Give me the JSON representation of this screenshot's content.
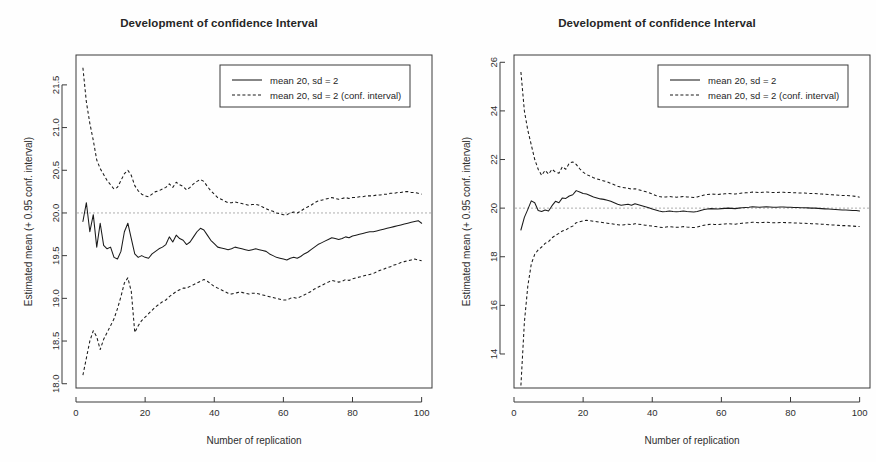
{
  "page": {
    "background_color": "#fefefe",
    "foreground_color": "#1a1a1a"
  },
  "panels": [
    {
      "name": "left-panel",
      "title": "Development of confidence Interval",
      "legend": {
        "solid_label": "mean 20, sd = 2",
        "dashed_label": "mean 20, sd = 2 (conf. interval)"
      }
    },
    {
      "name": "right-panel",
      "title": "Development of confidence Interval",
      "legend": {
        "solid_label": "mean 20, sd = 2",
        "dashed_label": "mean 20, sd = 2 (conf. interval)"
      }
    }
  ],
  "chart_data": [
    {
      "type": "line",
      "name": "left-chart",
      "title": "Development of confidence Interval",
      "xlabel": "Number of replication",
      "ylabel": "Estimated mean (+ 0.95 conf. interval)",
      "xlim": [
        0,
        103
      ],
      "ylim": [
        17.95,
        21.85
      ],
      "xticks": [
        0,
        20,
        40,
        60,
        80,
        100
      ],
      "xtick_labels": [
        "0",
        "20",
        "40",
        "60",
        "80",
        "100"
      ],
      "yticks": [
        18.0,
        18.5,
        19.0,
        19.5,
        20.0,
        20.5,
        21.0,
        21.5
      ],
      "ytick_labels": [
        "18.0",
        "18.5",
        "19.0",
        "19.5",
        "20.0",
        "20.5",
        "21.0",
        "21.5"
      ],
      "grid": false,
      "reference_line": 20.0,
      "legend_position": "top-right",
      "x": [
        2,
        3,
        4,
        5,
        6,
        7,
        8,
        9,
        10,
        11,
        12,
        13,
        14,
        15,
        16,
        17,
        18,
        19,
        20,
        21,
        22,
        23,
        24,
        25,
        26,
        27,
        28,
        29,
        30,
        31,
        32,
        33,
        34,
        35,
        36,
        37,
        38,
        39,
        40,
        41,
        42,
        43,
        44,
        45,
        46,
        47,
        48,
        49,
        50,
        51,
        52,
        53,
        54,
        55,
        56,
        57,
        58,
        59,
        60,
        61,
        62,
        63,
        64,
        65,
        66,
        67,
        68,
        69,
        70,
        71,
        72,
        73,
        74,
        75,
        76,
        77,
        78,
        79,
        80,
        81,
        82,
        83,
        84,
        85,
        86,
        87,
        88,
        89,
        90,
        91,
        92,
        93,
        94,
        95,
        96,
        97,
        98,
        99,
        100
      ],
      "series": [
        {
          "name": "mean 20, sd = 2",
          "style": "solid",
          "values": [
            19.9,
            20.12,
            19.78,
            19.98,
            19.6,
            19.88,
            19.62,
            19.58,
            19.6,
            19.48,
            19.46,
            19.55,
            19.78,
            19.88,
            19.7,
            19.52,
            19.48,
            19.5,
            19.48,
            19.47,
            19.52,
            19.55,
            19.58,
            19.6,
            19.63,
            19.72,
            19.66,
            19.74,
            19.7,
            19.68,
            19.63,
            19.66,
            19.72,
            19.78,
            19.82,
            19.8,
            19.74,
            19.68,
            19.64,
            19.6,
            19.59,
            19.58,
            19.57,
            19.58,
            19.6,
            19.59,
            19.58,
            19.57,
            19.56,
            19.57,
            19.58,
            19.57,
            19.56,
            19.55,
            19.52,
            19.5,
            19.48,
            19.47,
            19.46,
            19.45,
            19.47,
            19.48,
            19.47,
            19.49,
            19.52,
            19.54,
            19.57,
            19.6,
            19.63,
            19.65,
            19.67,
            19.69,
            19.71,
            19.7,
            19.69,
            19.7,
            19.72,
            19.71,
            19.73,
            19.74,
            19.75,
            19.76,
            19.77,
            19.78,
            19.78,
            19.79,
            19.8,
            19.81,
            19.82,
            19.83,
            19.84,
            19.85,
            19.86,
            19.87,
            19.88,
            19.89,
            19.9,
            19.91,
            19.88
          ]
        },
        {
          "name": "mean 20, sd = 2 (upper conf. interval)",
          "style": "dashed",
          "values": [
            21.7,
            21.3,
            21.05,
            20.85,
            20.62,
            20.52,
            20.45,
            20.38,
            20.33,
            20.28,
            20.3,
            20.38,
            20.46,
            20.5,
            20.44,
            20.32,
            20.26,
            20.22,
            20.2,
            20.19,
            20.22,
            20.25,
            20.26,
            20.28,
            20.3,
            20.34,
            20.3,
            20.36,
            20.33,
            20.31,
            20.27,
            20.3,
            20.34,
            20.37,
            20.39,
            20.37,
            20.31,
            20.26,
            20.22,
            20.18,
            20.16,
            20.14,
            20.12,
            20.12,
            20.13,
            20.12,
            20.11,
            20.1,
            20.09,
            20.1,
            20.1,
            20.09,
            20.07,
            20.05,
            20.03,
            20.02,
            20.0,
            19.99,
            19.98,
            19.98,
            20.0,
            20.01,
            20.0,
            20.02,
            20.05,
            20.07,
            20.09,
            20.12,
            20.14,
            20.15,
            20.16,
            20.17,
            20.18,
            20.17,
            20.16,
            20.17,
            20.18,
            20.17,
            20.18,
            20.18,
            20.19,
            20.19,
            20.2,
            20.2,
            20.2,
            20.21,
            20.21,
            20.22,
            20.22,
            20.23,
            20.23,
            20.24,
            20.24,
            20.25,
            20.25,
            20.24,
            20.24,
            20.23,
            20.22
          ]
        },
        {
          "name": "mean 20, sd = 2 (lower conf. interval)",
          "style": "dashed",
          "values": [
            18.1,
            18.3,
            18.5,
            18.62,
            18.55,
            18.4,
            18.52,
            18.6,
            18.68,
            18.76,
            18.88,
            19.02,
            19.18,
            19.24,
            19.08,
            18.6,
            18.68,
            18.74,
            18.78,
            18.82,
            18.86,
            18.9,
            18.93,
            18.96,
            18.98,
            19.02,
            19.05,
            19.08,
            19.1,
            19.12,
            19.12,
            19.14,
            19.16,
            19.18,
            19.2,
            19.22,
            19.2,
            19.17,
            19.14,
            19.12,
            19.1,
            19.08,
            19.06,
            19.05,
            19.06,
            19.07,
            19.07,
            19.06,
            19.05,
            19.06,
            19.06,
            19.05,
            19.04,
            19.03,
            19.02,
            19.01,
            19.0,
            18.99,
            18.98,
            18.98,
            19.0,
            19.01,
            19.0,
            19.02,
            19.04,
            19.06,
            19.08,
            19.11,
            19.13,
            19.15,
            19.17,
            19.19,
            19.21,
            19.2,
            19.19,
            19.2,
            19.22,
            19.21,
            19.23,
            19.24,
            19.25,
            19.26,
            19.27,
            19.28,
            19.29,
            19.31,
            19.33,
            19.34,
            19.36,
            19.37,
            19.39,
            19.4,
            19.42,
            19.43,
            19.44,
            19.45,
            19.46,
            19.45,
            19.44
          ]
        }
      ]
    },
    {
      "type": "line",
      "name": "right-chart",
      "title": "Development of confidence Interval",
      "xlabel": "Number of replication",
      "ylabel": "Estimated mean (+ 0.95 conf. interval)",
      "xlim": [
        0,
        103
      ],
      "ylim": [
        12.6,
        26.3
      ],
      "xticks": [
        0,
        20,
        40,
        60,
        80,
        100
      ],
      "xtick_labels": [
        "0",
        "20",
        "40",
        "60",
        "80",
        "100"
      ],
      "yticks": [
        14,
        16,
        18,
        20,
        22,
        24,
        26
      ],
      "ytick_labels": [
        "14",
        "16",
        "18",
        "20",
        "22",
        "24",
        "26"
      ],
      "grid": false,
      "reference_line": 20.0,
      "legend_position": "top-right",
      "x": [
        2,
        3,
        4,
        5,
        6,
        7,
        8,
        9,
        10,
        11,
        12,
        13,
        14,
        15,
        16,
        17,
        18,
        19,
        20,
        21,
        22,
        23,
        24,
        25,
        26,
        27,
        28,
        29,
        30,
        31,
        32,
        33,
        34,
        35,
        36,
        37,
        38,
        39,
        40,
        41,
        42,
        43,
        44,
        45,
        46,
        47,
        48,
        49,
        50,
        51,
        52,
        53,
        54,
        55,
        56,
        57,
        58,
        59,
        60,
        61,
        62,
        63,
        64,
        65,
        66,
        67,
        68,
        69,
        70,
        71,
        72,
        73,
        74,
        75,
        76,
        77,
        78,
        79,
        80,
        81,
        82,
        83,
        84,
        85,
        86,
        87,
        88,
        89,
        90,
        91,
        92,
        93,
        94,
        95,
        96,
        97,
        98,
        99,
        100
      ],
      "series": [
        {
          "name": "mean 20, sd = 2",
          "style": "solid",
          "values": [
            19.1,
            19.62,
            19.95,
            20.3,
            20.22,
            19.9,
            19.86,
            19.92,
            19.88,
            20.1,
            20.28,
            20.22,
            20.42,
            20.4,
            20.5,
            20.55,
            20.72,
            20.66,
            20.6,
            20.58,
            20.52,
            20.46,
            20.42,
            20.38,
            20.36,
            20.32,
            20.28,
            20.22,
            20.16,
            20.12,
            20.14,
            20.16,
            20.12,
            20.18,
            20.14,
            20.1,
            20.06,
            20.02,
            19.96,
            19.92,
            19.88,
            19.85,
            19.86,
            19.88,
            19.86,
            19.85,
            19.86,
            19.88,
            19.86,
            19.85,
            19.84,
            19.86,
            19.9,
            19.94,
            19.96,
            19.98,
            19.97,
            19.96,
            19.98,
            19.99,
            20.0,
            19.99,
            19.98,
            20.0,
            20.02,
            20.03,
            20.04,
            20.06,
            20.05,
            20.04,
            20.05,
            20.06,
            20.05,
            20.04,
            20.04,
            20.05,
            20.05,
            20.04,
            20.04,
            20.03,
            20.03,
            20.02,
            20.02,
            20.01,
            20.0,
            20.0,
            19.99,
            19.98,
            19.97,
            19.96,
            19.95,
            19.94,
            19.93,
            19.92,
            19.92,
            19.91,
            19.9,
            19.9,
            19.88
          ]
        },
        {
          "name": "mean 20, sd = 2 (upper conf. interval)",
          "style": "dashed",
          "values": [
            25.6,
            24.0,
            23.2,
            22.6,
            22.0,
            21.6,
            21.35,
            21.55,
            21.4,
            21.6,
            21.48,
            21.44,
            21.7,
            21.6,
            21.85,
            21.9,
            21.8,
            21.62,
            21.48,
            21.38,
            21.32,
            21.25,
            21.2,
            21.16,
            21.12,
            21.08,
            21.02,
            20.96,
            20.9,
            20.86,
            20.84,
            20.82,
            20.78,
            20.8,
            20.76,
            20.72,
            20.68,
            20.64,
            20.58,
            20.52,
            20.48,
            20.45,
            20.46,
            20.48,
            20.46,
            20.45,
            20.46,
            20.48,
            20.46,
            20.45,
            20.44,
            20.46,
            20.5,
            20.54,
            20.56,
            20.58,
            20.57,
            20.56,
            20.58,
            20.59,
            20.6,
            20.59,
            20.58,
            20.6,
            20.62,
            20.63,
            20.64,
            20.66,
            20.65,
            20.64,
            20.65,
            20.66,
            20.65,
            20.64,
            20.64,
            20.65,
            20.65,
            20.64,
            20.64,
            20.63,
            20.63,
            20.62,
            20.62,
            20.61,
            20.6,
            20.6,
            20.59,
            20.58,
            20.57,
            20.56,
            20.55,
            20.54,
            20.53,
            20.52,
            20.52,
            20.51,
            20.5,
            20.48,
            20.45
          ]
        },
        {
          "name": "mean 20, sd = 2 (lower conf. interval)",
          "style": "dashed",
          "values": [
            12.7,
            15.3,
            16.8,
            17.7,
            18.1,
            18.28,
            18.4,
            18.55,
            18.62,
            18.78,
            18.88,
            18.96,
            19.06,
            19.1,
            19.2,
            19.26,
            19.4,
            19.44,
            19.48,
            19.5,
            19.48,
            19.46,
            19.44,
            19.42,
            19.4,
            19.38,
            19.36,
            19.34,
            19.32,
            19.3,
            19.32,
            19.34,
            19.32,
            19.36,
            19.34,
            19.32,
            19.3,
            19.28,
            19.26,
            19.24,
            19.22,
            19.2,
            19.22,
            19.24,
            19.22,
            19.21,
            19.22,
            19.24,
            19.22,
            19.21,
            19.2,
            19.22,
            19.26,
            19.3,
            19.32,
            19.34,
            19.33,
            19.32,
            19.34,
            19.35,
            19.36,
            19.35,
            19.34,
            19.36,
            19.38,
            19.39,
            19.4,
            19.42,
            19.41,
            19.4,
            19.41,
            19.42,
            19.41,
            19.4,
            19.4,
            19.41,
            19.41,
            19.4,
            19.4,
            19.39,
            19.39,
            19.38,
            19.38,
            19.37,
            19.36,
            19.36,
            19.35,
            19.34,
            19.33,
            19.32,
            19.31,
            19.3,
            19.29,
            19.28,
            19.28,
            19.27,
            19.26,
            19.25,
            19.24
          ]
        }
      ]
    }
  ]
}
